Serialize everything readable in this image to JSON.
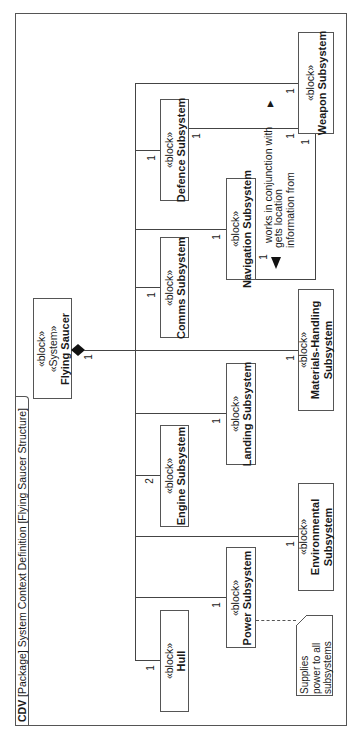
{
  "diagram": {
    "orientation": "rotated-90-ccw",
    "frame": {
      "kind": "CDV",
      "element_type": "[Package]",
      "title": "System Context Definition [Flying Saucer Structure]"
    },
    "system": {
      "stereotypes": [
        "«block»",
        "«System»"
      ],
      "name": "Flying Saucer",
      "composite_multiplicity": "1"
    },
    "blocks": [
      {
        "id": "defence",
        "stereotype": "«block»",
        "name": "Defence Subsystem",
        "multiplicity": "1"
      },
      {
        "id": "comms",
        "stereotype": "«block»",
        "name": "Comms Subsystem",
        "multiplicity": "1"
      },
      {
        "id": "engine",
        "stereotype": "«block»",
        "name": "Engine Subsystem",
        "multiplicity": "2"
      },
      {
        "id": "hull",
        "stereotype": "«block»",
        "name": "Hull",
        "multiplicity": "1"
      },
      {
        "id": "navigation",
        "stereotype": "«block»",
        "name": "Navigation Subsystem",
        "multiplicity": "1"
      },
      {
        "id": "landing",
        "stereotype": "«block»",
        "name": "Landing Subsystem",
        "multiplicity": "1"
      },
      {
        "id": "power",
        "stereotype": "«block»",
        "name": "Power Subsystem",
        "multiplicity": "1"
      },
      {
        "id": "weapon",
        "stereotype": "«block»",
        "name": "Weapon Subsystem",
        "multiplicity": "1"
      },
      {
        "id": "materials",
        "stereotype": "«block»",
        "name_line1": "Materials-Handling",
        "name_line2": "Subsystem",
        "multiplicity": "1"
      },
      {
        "id": "environmental",
        "stereotype": "«block»",
        "name_line1": "Environmental",
        "name_line2": "Subsystem",
        "multiplicity": "1"
      }
    ],
    "associations": [
      {
        "from": "weapon",
        "to": "defence",
        "label": "works in conjunction with",
        "from_mult": "1",
        "to_mult": "1",
        "direction_marker": "▲"
      },
      {
        "from": "weapon",
        "to": "navigation",
        "label_line1": "gets location",
        "label_line2": "information from",
        "from_mult": "1",
        "to_mult": "1",
        "direction_marker": "◀"
      }
    ],
    "note": {
      "text": "Supplies\npower to all\nsubsystems",
      "attached_to": "power"
    },
    "colors": {
      "line": "#444444",
      "border": "#555555",
      "background": "#ffffff",
      "text": "#1a1a1a"
    }
  }
}
